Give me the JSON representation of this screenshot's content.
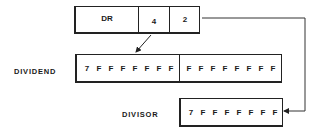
{
  "register": {
    "name_label": "DR",
    "field_a": "4",
    "field_b": "2"
  },
  "dividend": {
    "label": "DIVIDEND",
    "high_word": [
      "7",
      "F",
      "F",
      "F",
      "F",
      "F",
      "F",
      "F"
    ],
    "low_word": [
      "F",
      "F",
      "F",
      "F",
      "F",
      "F",
      "F",
      "F"
    ]
  },
  "divisor": {
    "label": "DIVISOR",
    "word": [
      "7",
      "F",
      "F",
      "F",
      "F",
      "F",
      "F",
      "F"
    ]
  }
}
